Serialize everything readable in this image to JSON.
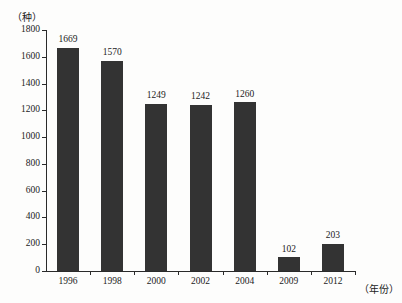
{
  "chart_data": {
    "type": "bar",
    "title": "",
    "xlabel": "（年份）",
    "ylabel": "（种）",
    "categories": [
      "1996",
      "1998",
      "2000",
      "2002",
      "2004",
      "2009",
      "2012"
    ],
    "values": [
      1669,
      1570,
      1249,
      1242,
      1260,
      102,
      203
    ],
    "value_labels": [
      "1669",
      "1570",
      "1249",
      "1242",
      "1260",
      "102",
      "203"
    ],
    "ylim": [
      0,
      1800
    ],
    "ytick_values": [
      0,
      200,
      400,
      600,
      800,
      1000,
      1200,
      1400,
      1600,
      1800
    ],
    "ytick_labels": [
      "0",
      "200",
      "400",
      "600",
      "800",
      "1000",
      "1200",
      "1400",
      "1600",
      "1800"
    ],
    "grid": false,
    "legend": false,
    "bar_color": "#333333",
    "axis_color": "#2a2a2a",
    "background_color": "#fdfdfc"
  }
}
